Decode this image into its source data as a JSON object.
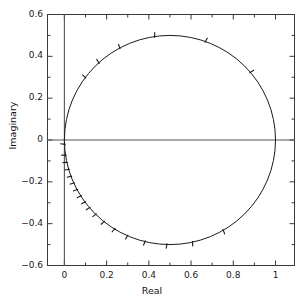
{
  "chart_data": {
    "type": "line",
    "title": "",
    "xlabel": "Real",
    "ylabel": "Imaginary",
    "xlim": [
      -0.08,
      1.09
    ],
    "ylim": [
      -0.6,
      0.6
    ],
    "grid": false,
    "legend": null,
    "aspect": "equal-ish",
    "xticks": [
      0,
      0.2,
      0.4,
      0.6,
      0.8,
      1
    ],
    "xtick_labels": [
      "0",
      "0.2",
      "0.4",
      "0.6",
      "0.8",
      "1"
    ],
    "xminor_step": 0.1,
    "yticks": [
      -0.6,
      -0.4,
      -0.2,
      0,
      0.2,
      0.4,
      0.6
    ],
    "ytick_labels": [
      "−0.6",
      "−0.4",
      "−0.2",
      "0",
      "0.2",
      "0.4",
      "0.6"
    ],
    "yminor_step": 0.1,
    "axis_lines": {
      "x_zero_line": 0,
      "y_zero_line": 0,
      "color": "#444444"
    },
    "series": [
      {
        "name": "locus-circle",
        "kind": "circle",
        "center": [
          0.5,
          0.0
        ],
        "radius": 0.5,
        "color": "#1a1a1a",
        "linewidth": 1.0,
        "description": "Closed circular locus passing through (0,0) and (1,0), peak imaginary +0.5 at real 0.5 and -0.5 at real 0.5"
      }
    ],
    "direction_marks": {
      "style": "hash-ticks",
      "color": "#1a1a1a",
      "description": "Short radial hash ticks placed along the circle, densely clustered near the origin in the lower-left quadrant and sparse elsewhere",
      "angles_deg": [
        40,
        70,
        98,
        118,
        132,
        143,
        182,
        188,
        192,
        196,
        200,
        204,
        208,
        212,
        216,
        220,
        225,
        231,
        238,
        246,
        256,
        268,
        282,
        300
      ]
    },
    "annotations": []
  },
  "axis": {
    "xlabel": "Real",
    "ylabel": "Imaginary"
  }
}
